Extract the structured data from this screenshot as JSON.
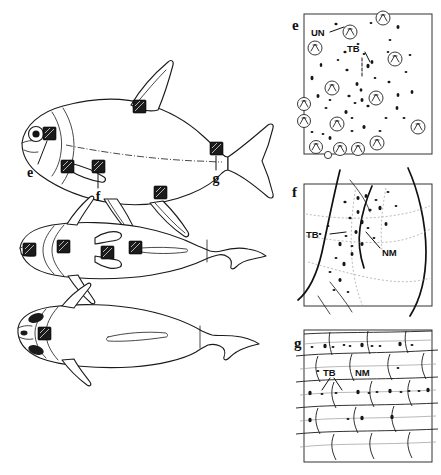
{
  "figure": {
    "background_color": "#ffffff",
    "ink_color": "#1a1a1a"
  },
  "fish_views": [
    {
      "id": "lateral",
      "name": "lateral-view",
      "label": ""
    },
    {
      "id": "dorsal",
      "name": "dorsal-view",
      "label": ""
    },
    {
      "id": "ventral",
      "name": "ventral-view",
      "label": ""
    }
  ],
  "site_labels": [
    {
      "key": "e",
      "text": "e"
    },
    {
      "key": "f",
      "text": "f"
    },
    {
      "key": "g",
      "text": "g"
    }
  ],
  "panels": [
    {
      "key": "e",
      "letter": "e",
      "name": "panel-e",
      "annotations": [
        {
          "key": "UN",
          "text": "UN"
        },
        {
          "key": "TB",
          "text": "TB"
        }
      ]
    },
    {
      "key": "f",
      "letter": "f",
      "name": "panel-f",
      "annotations": [
        {
          "key": "TB",
          "text": "TB"
        },
        {
          "key": "NM",
          "text": "NM"
        }
      ]
    },
    {
      "key": "g",
      "letter": "g",
      "name": "panel-g",
      "annotations": [
        {
          "key": "TB",
          "text": "TB"
        },
        {
          "key": "NM",
          "text": "NM"
        }
      ]
    }
  ],
  "abbreviations": {
    "UN": "UN",
    "TB": "TB",
    "NM": "NM"
  }
}
